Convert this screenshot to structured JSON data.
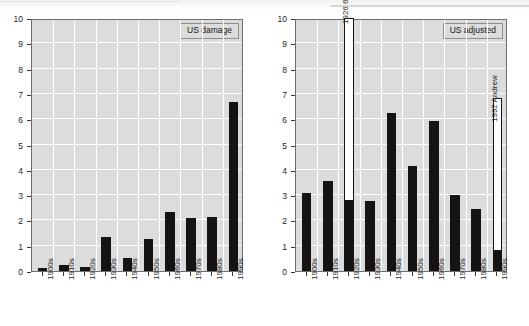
{
  "figure": {
    "ylabel": "US cyclone damage, billion 2000 US$ per year"
  },
  "chart_data": [
    {
      "type": "bar",
      "panel": "left",
      "title": "US damage",
      "legend_label": "US damage",
      "legend_position": "top-right inside plot",
      "xlabel": "",
      "ylabel": "US cyclone damage, billion 2000 US$ per year",
      "ylim": [
        0,
        10
      ],
      "yticks": [
        0,
        1,
        2,
        3,
        4,
        5,
        6,
        7,
        8,
        9,
        10
      ],
      "ytick_labels": [
        "0",
        "1",
        "2",
        "3",
        "4",
        "5",
        "6",
        "7",
        "8",
        "9",
        "10"
      ],
      "grid": true,
      "categories": [
        "1900s",
        "1910s",
        "1920s",
        "1930s",
        "1940s",
        "1950s",
        "1960s",
        "1970s",
        "1980s",
        "1990s"
      ],
      "values": [
        0.12,
        0.22,
        0.17,
        1.33,
        0.52,
        1.27,
        2.35,
        2.1,
        2.15,
        6.68
      ],
      "bar_color": "#141414",
      "plot_bg": "#dcdcdc",
      "annotations": []
    },
    {
      "type": "bar",
      "panel": "right",
      "title": "US adjusted",
      "legend_label": "US adjusted",
      "legend_position": "top-right inside plot",
      "xlabel": "",
      "ylabel": "",
      "ylim": [
        0,
        10
      ],
      "yticks": [
        0,
        1,
        2,
        3,
        4,
        5,
        6,
        7,
        8,
        9,
        10
      ],
      "ytick_labels": [
        "0",
        "1",
        "2",
        "3",
        "4",
        "5",
        "6",
        "7",
        "8",
        "9",
        "10"
      ],
      "grid": true,
      "categories": [
        "1900s",
        "1910s",
        "1920s",
        "1930s",
        "1940s",
        "1950s",
        "1960s",
        "1970s",
        "1980s",
        "1990s"
      ],
      "series": [
        {
          "name": "US adjusted",
          "style": "filled",
          "values": [
            3.07,
            3.57,
            2.8,
            2.75,
            6.25,
            4.15,
            5.93,
            3.0,
            2.45,
            0.85
          ]
        },
        {
          "name": "single-event contribution (open bar)",
          "style": "open-outline",
          "values": [
            null,
            null,
            10.0,
            null,
            null,
            null,
            null,
            null,
            null,
            6.83
          ]
        }
      ],
      "bar_color": "#141414",
      "open_bar_color": "#ffffff",
      "plot_bg": "#dcdcdc",
      "annotations": [
        {
          "category": "1920s",
          "text": "1926 6 (Dade & Broward)",
          "orientation": "vertical"
        },
        {
          "category": "1990s",
          "text": "1992 Andrew",
          "orientation": "vertical"
        }
      ]
    }
  ],
  "panels": {
    "left": {
      "legend": "US damage",
      "ylabel": "US cyclone damage, billion 2000 US$ per year",
      "ytick_labels": [
        "10",
        "9",
        "8",
        "7",
        "6",
        "5",
        "4",
        "3",
        "2",
        "1",
        "0"
      ],
      "xtick_labels": [
        "1900s",
        "1910s",
        "1920s",
        "1930s",
        "1940s",
        "1950s",
        "1960s",
        "1970s",
        "1980s",
        "1990s"
      ]
    },
    "right": {
      "legend": "US adjusted",
      "ytick_labels": [
        "10",
        "9",
        "8",
        "7",
        "6",
        "5",
        "4",
        "3",
        "2",
        "1",
        "0"
      ],
      "xtick_labels": [
        "1900s",
        "1910s",
        "1920s",
        "1930s",
        "1940s",
        "1950s",
        "1960s",
        "1970s",
        "1980s",
        "1990s"
      ],
      "annotation_1920s": "1926 6 (Dade & Broward)",
      "annotation_1990s": "1992 Andrew"
    }
  }
}
